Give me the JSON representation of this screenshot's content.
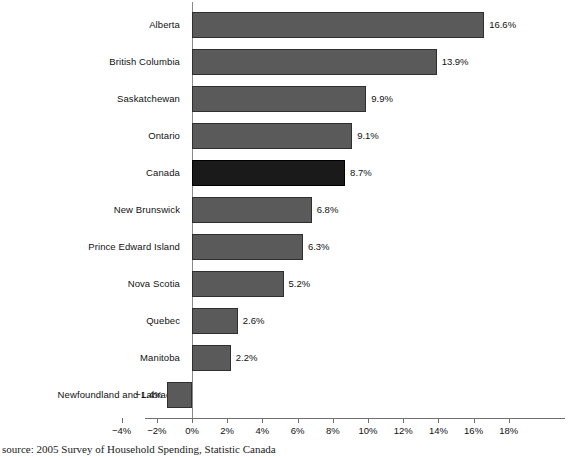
{
  "chart_data": {
    "type": "bar",
    "orientation": "horizontal",
    "title": "",
    "subtitle": "",
    "xlabel": "",
    "ylabel": "",
    "categories": [
      "Alberta",
      "British Columbia",
      "Saskatchewan",
      "Ontario",
      "Canada",
      "New Brunswick",
      "Prince Edward Island",
      "Nova Scotia",
      "Quebec",
      "Manitoba",
      "Newfoundland and Labrador"
    ],
    "values": [
      16.6,
      13.9,
      9.9,
      9.1,
      8.7,
      6.8,
      6.3,
      5.2,
      2.6,
      2.2,
      -1.4
    ],
    "data_labels": [
      "16.6%",
      "13.9%",
      "9.9%",
      "9.1%",
      "8.7%",
      "6.8%",
      "6.3%",
      "5.2%",
      "2.6%",
      "2.2%",
      "−1.4%"
    ],
    "highlight_index": 4,
    "xlim": [
      -4,
      18
    ],
    "xtick_values": [
      -4,
      -2,
      0,
      2,
      4,
      6,
      8,
      10,
      12,
      14,
      16,
      18
    ],
    "xtick_labels": [
      "−4%",
      "−2%",
      "0%",
      "2%",
      "4%",
      "6%",
      "8%",
      "10%",
      "12%",
      "14%",
      "16%",
      "18%"
    ],
    "grid": false,
    "legend": null,
    "colors": {
      "bar": "#5a5a5a",
      "bar_highlight": "#1a1a1a",
      "bar_border": "#2f2f2f",
      "axis": "#6f6f6f",
      "text": "#111111",
      "background": "#ffffff"
    }
  },
  "caption": {
    "source": "source: 2005 Survey of Household Spending, Statistic Canada"
  }
}
